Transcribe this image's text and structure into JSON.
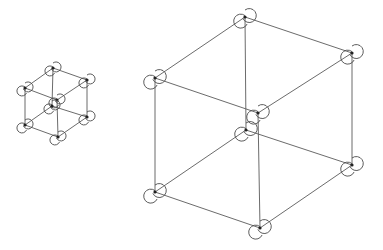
{
  "diagram": {
    "type": "wireframe-cubes",
    "colors": {
      "background": "#ffffff",
      "edge": "#5a5a5a",
      "marker": "#4a4a4a",
      "vertex": "#222222"
    },
    "cubes": [
      {
        "name": "small-cube",
        "vertices": {
          "top_back": [
            53,
            68
          ],
          "left_top": [
            25,
            88
          ],
          "right_top": [
            87,
            80
          ],
          "front_top": [
            57,
            100
          ],
          "back_bottom": [
            52,
            106
          ],
          "left_bottom": [
            25,
            125
          ],
          "right_bottom": [
            87,
            117
          ],
          "front_bottom": [
            58,
            137
          ]
        },
        "marker_radius": 5
      },
      {
        "name": "large-cube",
        "vertices": {
          "top_back": [
            245,
            17
          ],
          "left_top": [
            155,
            78
          ],
          "right_top": [
            352,
            53
          ],
          "front_top": [
            258,
            113
          ],
          "back_bottom": [
            246,
            130
          ],
          "left_bottom": [
            155,
            192
          ],
          "right_bottom": [
            352,
            165
          ],
          "front_bottom": [
            260,
            228
          ]
        },
        "marker_radius": 7
      }
    ],
    "edges": [
      [
        "top_back",
        "left_top"
      ],
      [
        "top_back",
        "right_top"
      ],
      [
        "left_top",
        "front_top"
      ],
      [
        "right_top",
        "front_top"
      ],
      [
        "back_bottom",
        "left_bottom"
      ],
      [
        "back_bottom",
        "right_bottom"
      ],
      [
        "left_bottom",
        "front_bottom"
      ],
      [
        "right_bottom",
        "front_bottom"
      ],
      [
        "top_back",
        "back_bottom"
      ],
      [
        "left_top",
        "left_bottom"
      ],
      [
        "right_top",
        "right_bottom"
      ],
      [
        "front_top",
        "front_bottom"
      ]
    ]
  }
}
